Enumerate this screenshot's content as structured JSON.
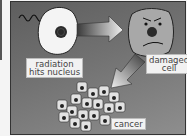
{
  "diagram": {
    "nodes": [
      {
        "id": "healthy-cell",
        "label_lines": [
          "radiation",
          "hits nucleus"
        ]
      },
      {
        "id": "damaged-cell",
        "label_lines": [
          "damaged",
          "cell"
        ]
      },
      {
        "id": "cancer-cluster",
        "label_lines": [
          "cancer"
        ]
      }
    ],
    "edges": [
      {
        "from": "healthy-cell",
        "to": "damaged-cell",
        "style": "gradient-arrow-right"
      },
      {
        "from": "damaged-cell",
        "to": "cancer-cluster",
        "style": "gradient-arrow-down-left"
      }
    ],
    "colors": {
      "background_dark": "#5e5e5e",
      "background_light": "#8e8e8e",
      "cell_fill_healthy": "#f4f4f4",
      "cell_fill_damaged": "#a8a8a8",
      "nucleus": "#2a2a2a",
      "label_bg": "#f2f2f2"
    }
  }
}
